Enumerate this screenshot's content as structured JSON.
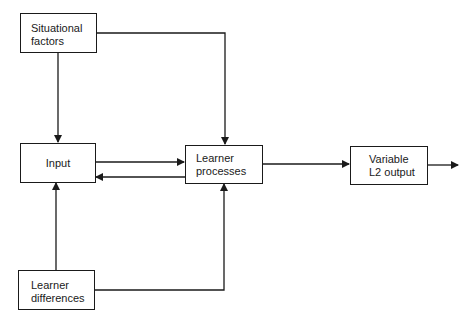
{
  "diagram": {
    "nodes": {
      "situational": {
        "line1": "Situational",
        "line2": "factors"
      },
      "input": {
        "label": "Input"
      },
      "processes": {
        "line1": "Learner",
        "line2": "processes"
      },
      "output": {
        "line1": "Variable",
        "line2": "L2 output"
      },
      "differences": {
        "line1": "Learner",
        "line2": "differences"
      }
    },
    "edges": [
      {
        "from": "Situational factors",
        "to": "Input"
      },
      {
        "from": "Situational factors",
        "to": "Learner processes"
      },
      {
        "from": "Input",
        "to": "Learner processes"
      },
      {
        "from": "Learner processes",
        "to": "Input"
      },
      {
        "from": "Learner differences",
        "to": "Input"
      },
      {
        "from": "Learner differences",
        "to": "Learner processes"
      },
      {
        "from": "Learner processes",
        "to": "Variable L2 output"
      },
      {
        "from": "Variable L2 output",
        "to": "outside"
      }
    ]
  }
}
